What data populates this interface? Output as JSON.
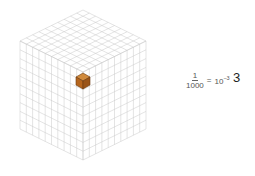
{
  "diagram": {
    "type": "subdivided-cube",
    "divisions": 10,
    "highlighted_cube": {
      "count": 1,
      "color": "#b5651d"
    },
    "grid_color": "#c8c8c8"
  },
  "equation": {
    "numerator": "1",
    "denominator": "1000",
    "operator": "=",
    "base": "10",
    "exponent": "−3"
  },
  "label": "3"
}
